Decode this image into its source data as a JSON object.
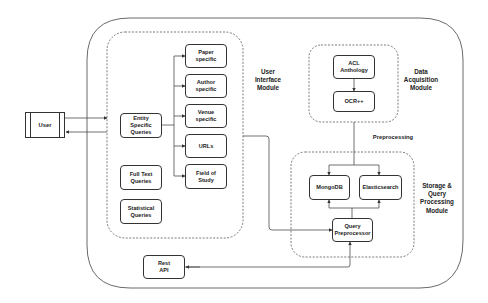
{
  "diagram": {
    "actor": {
      "label": "User"
    },
    "modules": {
      "ui": {
        "label": "User\nInterface\nModule",
        "entity_queries": "Entity\nSpecific\nQueries",
        "sub_queries": [
          "Paper\nspecific",
          "Author\nspecific",
          "Venue\nspecific",
          "URLs",
          "Field of\nStudy"
        ],
        "full_text": "Full Text\nQueries",
        "statistical": "Statistical\nQueries"
      },
      "data_acquisition": {
        "label": "Data\nAcquisition\nModule",
        "source": "ACL\nAnthology",
        "ocr": "OCR++"
      },
      "storage": {
        "label": "Storage &\nQuery\nProcessing\nModule",
        "mongodb": "MongoDB",
        "elasticsearch": "Elasticsearch",
        "query_preprocessor": "Query\nPreprocessor"
      }
    },
    "edge_labels": {
      "preprocessing": "Preprocessing"
    },
    "rest_api": "Rest\nAPI",
    "colors": {
      "stroke": "#333333",
      "text": "#222222",
      "background": "#ffffff"
    }
  }
}
